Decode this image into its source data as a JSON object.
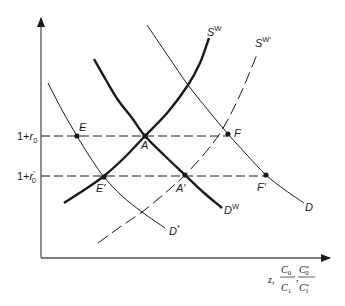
{
  "diagram": {
    "type": "supply-demand",
    "axes": {
      "origin": [
        41,
        258
      ],
      "y_axis_top": 18,
      "x_axis_right": 330,
      "x_label": {
        "prefix": "z,",
        "frac1_num": "C",
        "frac1_num_sub": "0",
        "frac1_den": "C",
        "frac1_den_sub": "1",
        "sep": ",",
        "frac2_num": "C",
        "frac2_num_sub": "0",
        "frac2_num_sup": "*",
        "frac2_den": "C",
        "frac2_den_sub": "1",
        "frac2_den_sup": "*"
      }
    },
    "rate_levels": [
      {
        "id": "r0",
        "y": 136,
        "x_end": 228,
        "prefix": "1+",
        "var": "r",
        "prime": "",
        "sub": "0"
      },
      {
        "id": "r0prime",
        "y": 176,
        "x_end": 266,
        "prefix": "1+",
        "var": "r",
        "prime": "′",
        "sub": "0"
      }
    ],
    "curves": [
      {
        "id": "SW",
        "name": "S",
        "sup": "W",
        "style": "thick",
        "points": [
          [
            64,
            203
          ],
          [
            84,
            190
          ],
          [
            104,
            176
          ],
          [
            125,
            157
          ],
          [
            145,
            136
          ],
          [
            168,
            112
          ],
          [
            188,
            85
          ],
          [
            200,
            63
          ],
          [
            209,
            38
          ]
        ],
        "label_pos": [
          207,
          36
        ]
      },
      {
        "id": "DW",
        "name": "D",
        "sup": "W",
        "style": "thick",
        "points": [
          [
            94,
            59
          ],
          [
            106,
            80
          ],
          [
            118,
            100
          ],
          [
            132,
            118
          ],
          [
            145,
            136
          ],
          [
            165,
            156
          ],
          [
            185,
            175
          ],
          [
            203,
            192
          ],
          [
            222,
            208
          ]
        ],
        "label_pos": [
          224,
          214
        ]
      },
      {
        "id": "Dstar",
        "name": "D",
        "sup": "*",
        "style": "thin",
        "points": [
          [
            48,
            83
          ],
          [
            62,
            110
          ],
          [
            77,
            136
          ],
          [
            90,
            157
          ],
          [
            104,
            177
          ],
          [
            122,
            196
          ],
          [
            142,
            212
          ],
          [
            165,
            228
          ]
        ],
        "label_pos": [
          169,
          235
        ]
      },
      {
        "id": "D",
        "name": "D",
        "sup": "",
        "style": "thin",
        "points": [
          [
            147,
            25
          ],
          [
            168,
            56
          ],
          [
            188,
            85
          ],
          [
            208,
            110
          ],
          [
            228,
            134
          ],
          [
            247,
            155
          ],
          [
            266,
            175
          ],
          [
            285,
            190
          ],
          [
            304,
            203
          ]
        ],
        "label_pos": [
          305,
          211
        ]
      },
      {
        "id": "SWprime",
        "name": "S",
        "sup": "W′",
        "style": "dashed",
        "points": [
          [
            98,
            243
          ],
          [
            120,
            227
          ],
          [
            142,
            212
          ],
          [
            164,
            194
          ],
          [
            185,
            175
          ],
          [
            205,
            153
          ],
          [
            222,
            130
          ],
          [
            240,
            95
          ],
          [
            258,
            52
          ]
        ],
        "label_pos": [
          255,
          47
        ]
      }
    ],
    "points": [
      {
        "id": "E",
        "label": "E",
        "at": [
          77,
          136
        ],
        "label_pos": [
          79,
          131
        ]
      },
      {
        "id": "A",
        "label": "A",
        "at": [
          145,
          136
        ],
        "label_pos": [
          141,
          149
        ]
      },
      {
        "id": "F",
        "label": "F",
        "at": [
          228,
          134
        ],
        "label_pos": [
          234,
          137
        ]
      },
      {
        "id": "Eprime",
        "label": "E′",
        "at": [
          104,
          177
        ],
        "label_pos": [
          96,
          192
        ]
      },
      {
        "id": "Aprime",
        "label": "A′",
        "at": [
          185,
          175
        ],
        "label_pos": [
          176,
          192
        ]
      },
      {
        "id": "Fprime",
        "label": "F′",
        "at": [
          266,
          175
        ],
        "label_pos": [
          257,
          191
        ]
      }
    ],
    "colors": {
      "ink": "#1a1a1a",
      "background": "#ffffff"
    }
  }
}
